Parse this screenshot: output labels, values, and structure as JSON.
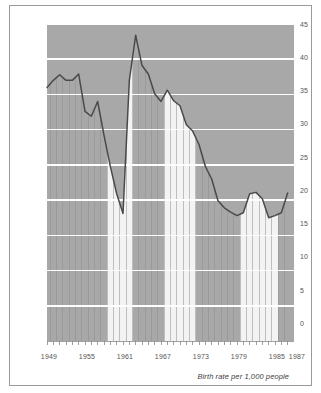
{
  "figure": {
    "caption": "Birth rate per 1,000 people",
    "frame_color": "#9a9a9a",
    "background": "#ffffff"
  },
  "chart_data": {
    "type": "line",
    "title": "",
    "subtitle": "",
    "xlabel": "",
    "ylabel": "",
    "annotation": "Birth rate per 1,000 people",
    "grid": true,
    "grid_color": "#ffffff",
    "plot_fill": "#a8a8a8",
    "band_fill_dark": "#a8a8a8",
    "band_fill_light": "#f3f3f3",
    "line_color": "#4a4a4a",
    "legend": [],
    "legend_position": "none",
    "xlim": [
      1949,
      1987
    ],
    "ylim": [
      0,
      45
    ],
    "ytick_values": [
      0,
      5,
      10,
      15,
      20,
      25,
      30,
      35,
      40,
      45
    ],
    "ytick_labels": [
      "0",
      "5",
      "10",
      "15",
      "20",
      "25",
      "30",
      "35",
      "40",
      "45"
    ],
    "xtick_labels": [
      "1949",
      "1955",
      "1961",
      "1967",
      "1973",
      "1979",
      "1985",
      "1987"
    ],
    "xtick_values": [
      1949,
      1955,
      1961,
      1967,
      1973,
      1979,
      1985,
      1987
    ],
    "x": [
      1949,
      1950,
      1951,
      1952,
      1953,
      1954,
      1955,
      1956,
      1957,
      1958,
      1959,
      1960,
      1961,
      1962,
      1963,
      1964,
      1965,
      1966,
      1967,
      1968,
      1969,
      1970,
      1971,
      1972,
      1973,
      1974,
      1975,
      1976,
      1977,
      1978,
      1979,
      1980,
      1981,
      1982,
      1983,
      1984,
      1985,
      1986,
      1987
    ],
    "values": [
      36.0,
      37.0,
      37.8,
      37.0,
      37.0,
      37.9,
      32.6,
      31.9,
      34.0,
      29.2,
      24.8,
      20.9,
      18.1,
      37.0,
      43.4,
      39.1,
      37.9,
      35.1,
      34.0,
      35.6,
      34.1,
      33.4,
      30.7,
      29.8,
      27.9,
      24.8,
      23.0,
      19.9,
      18.9,
      18.3,
      17.8,
      18.2,
      20.9,
      21.1,
      20.2,
      17.5,
      17.8,
      18.2,
      21.0
    ],
    "bands": [
      {
        "label": "1949-1958",
        "start_year": 1949,
        "end_year": 1958,
        "fill": "dark"
      },
      {
        "label": "1959-1962",
        "start_year": 1959,
        "end_year": 1962,
        "fill": "light"
      },
      {
        "label": "1963-1967",
        "start_year": 1963,
        "end_year": 1967,
        "fill": "dark"
      },
      {
        "label": "1968-1972",
        "start_year": 1968,
        "end_year": 1972,
        "fill": "light"
      },
      {
        "label": "1973-1979",
        "start_year": 1973,
        "end_year": 1979,
        "fill": "dark"
      },
      {
        "label": "1980-1985",
        "start_year": 1980,
        "end_year": 1985,
        "fill": "light"
      },
      {
        "label": "1986-1987",
        "start_year": 1986,
        "end_year": 1987,
        "fill": "dark"
      }
    ]
  }
}
